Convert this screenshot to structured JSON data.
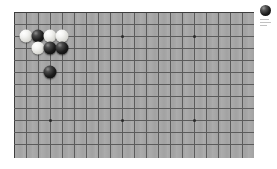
{
  "app": {
    "title": "Go Board",
    "board_color": "#a8a8a8",
    "line_color": "#5b5b5b",
    "background": "#ffffff"
  },
  "board": {
    "name": "go-board",
    "visible_columns": 20,
    "visible_rows": 12,
    "cell_size_px": 12,
    "origin_x_px": 14,
    "origin_y_px": 12,
    "star_points": [
      {
        "col": 3,
        "row": 2
      },
      {
        "col": 9,
        "row": 2
      },
      {
        "col": 15,
        "row": 2
      },
      {
        "col": 3,
        "row": 9
      },
      {
        "col": 9,
        "row": 9
      },
      {
        "col": 15,
        "row": 9
      }
    ],
    "stones": [
      {
        "color": "white",
        "col": 1,
        "row": 2,
        "label": "white-stone-1"
      },
      {
        "color": "black",
        "col": 2,
        "row": 2,
        "label": "black-stone-1"
      },
      {
        "color": "white",
        "col": 3,
        "row": 2,
        "label": "white-stone-2"
      },
      {
        "color": "white",
        "col": 4,
        "row": 2,
        "label": "white-stone-3"
      },
      {
        "color": "white",
        "col": 2,
        "row": 3,
        "label": "white-stone-4"
      },
      {
        "color": "black",
        "col": 3,
        "row": 3,
        "label": "black-stone-2"
      },
      {
        "color": "black",
        "col": 4,
        "row": 3,
        "label": "black-stone-3"
      },
      {
        "color": "black",
        "col": 3,
        "row": 5,
        "label": "black-stone-4"
      }
    ],
    "stone_counts": {
      "black": 4,
      "white": 4
    }
  },
  "side_panel": {
    "turn_icon": "black-stone-icon",
    "turn_color": "black",
    "lines": [
      "",
      "",
      ""
    ]
  }
}
